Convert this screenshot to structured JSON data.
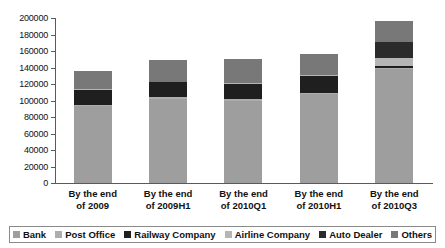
{
  "chart_data": {
    "type": "bar",
    "stacked": true,
    "title": "",
    "xlabel": "",
    "ylabel": "",
    "ylim": [
      0,
      200000
    ],
    "ytick_step": 20000,
    "yticks": [
      0,
      20000,
      40000,
      60000,
      80000,
      100000,
      120000,
      140000,
      160000,
      180000,
      200000
    ],
    "ytick_labels": [
      "0",
      "20000",
      "40000",
      "60000",
      "80000",
      "100000",
      "120000",
      "140000",
      "160000",
      "180000",
      "200000"
    ],
    "grid": false,
    "legend_position": "bottom",
    "categories": [
      "By the end of 2009",
      "By the end of 2009H1",
      "By the end of 2010Q1",
      "By the end of 2010H1",
      "By the end of 2010Q3"
    ],
    "category_lines": [
      [
        "By the end",
        "of 2009"
      ],
      [
        "By the end",
        "of 2009H1"
      ],
      [
        "By the end",
        "of 2010Q1"
      ],
      [
        "By the end",
        "of 2010H1"
      ],
      [
        "By the end",
        "of 2010Q3"
      ]
    ],
    "series": [
      {
        "name": "Bank",
        "color": "#9e9e9e",
        "values": [
          93000,
          102000,
          99000,
          108000,
          138000
        ]
      },
      {
        "name": "Post Office",
        "color": "#adadad",
        "values": [
          2000,
          2000,
          2500,
          1500,
          1500
        ]
      },
      {
        "name": "Railway Company",
        "color": "#1f1f1f",
        "values": [
          18000,
          18000,
          18000,
          20000,
          2500
        ]
      },
      {
        "name": "Airline Company",
        "color": "#b5b5b5",
        "values": [
          1000,
          1000,
          1500,
          1000,
          9000
        ]
      },
      {
        "name": "Auto Dealer",
        "color": "#2b2b2b",
        "values": [
          0,
          0,
          0,
          0,
          20000
        ]
      },
      {
        "name": "Others",
        "color": "#787878",
        "values": [
          22000,
          26000,
          29000,
          26000,
          25000
        ]
      }
    ],
    "totals": [
      136000,
      149000,
      150000,
      156500,
      196000
    ]
  },
  "legend": {
    "items": [
      {
        "label": "Bank",
        "swatch": "#9e9e9e"
      },
      {
        "label": "Post Office",
        "swatch": "#adadad"
      },
      {
        "label": "Railway Company",
        "swatch": "#1f1f1f"
      },
      {
        "label": "Airline Company",
        "swatch": "#b5b5b5"
      },
      {
        "label": "Auto Dealer",
        "swatch": "#2b2b2b"
      },
      {
        "label": "Others",
        "swatch": "#787878"
      }
    ]
  }
}
